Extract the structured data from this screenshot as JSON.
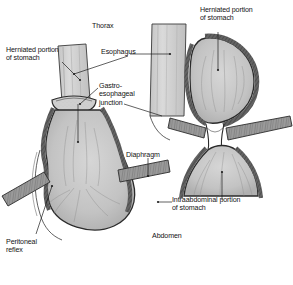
{
  "figure": {
    "background_color": "#ffffff",
    "ink_color": "#1a1a1a",
    "tissue_fill": "#c9c9c9",
    "wall_fill": "#6e6e6e",
    "lumen_fill": "#b5b5b5"
  },
  "labels": {
    "thorax": "Thorax",
    "abdomen": "Abdomen",
    "esophagus": "Esophagus",
    "diaphragm": "Diaphragm",
    "herniated_left": "Herniated portion\nof stomach",
    "herniated_right": "Herniated portion\nof stomach",
    "ge_junction": "Gastro-\nesophageal\njunction",
    "intraabdominal": "Intraabdominal portion\nof stomach",
    "peritoneal": "Peritoneal\nreflex"
  },
  "caption": {
    "line1": "",
    "line2": ""
  },
  "parts": {
    "left_view_name": "left-cutaway-view",
    "right_view_name": "right-cutaway-view"
  }
}
